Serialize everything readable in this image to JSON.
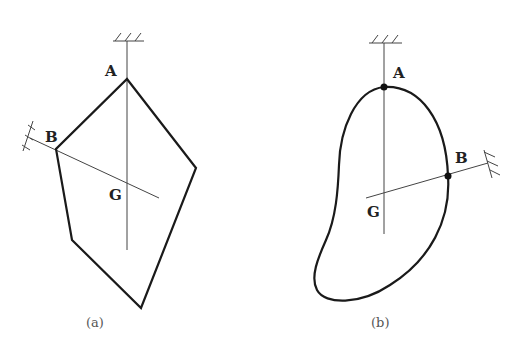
{
  "figure_a": {
    "caption": "(a)",
    "shape": "polygon",
    "labels": {
      "A": "A",
      "B": "B",
      "G": "G"
    },
    "vertices": [
      [
        127,
        79
      ],
      [
        196,
        168
      ],
      [
        141,
        308
      ],
      [
        72,
        240
      ],
      [
        56,
        149
      ]
    ]
  },
  "figure_b": {
    "caption": "(b)",
    "shape": "closed-curve",
    "labels": {
      "A": "A",
      "B": "B",
      "G": "G"
    }
  },
  "colors": {
    "stroke": "#1a1a1a",
    "thin": "#444444",
    "background": "#ffffff"
  }
}
